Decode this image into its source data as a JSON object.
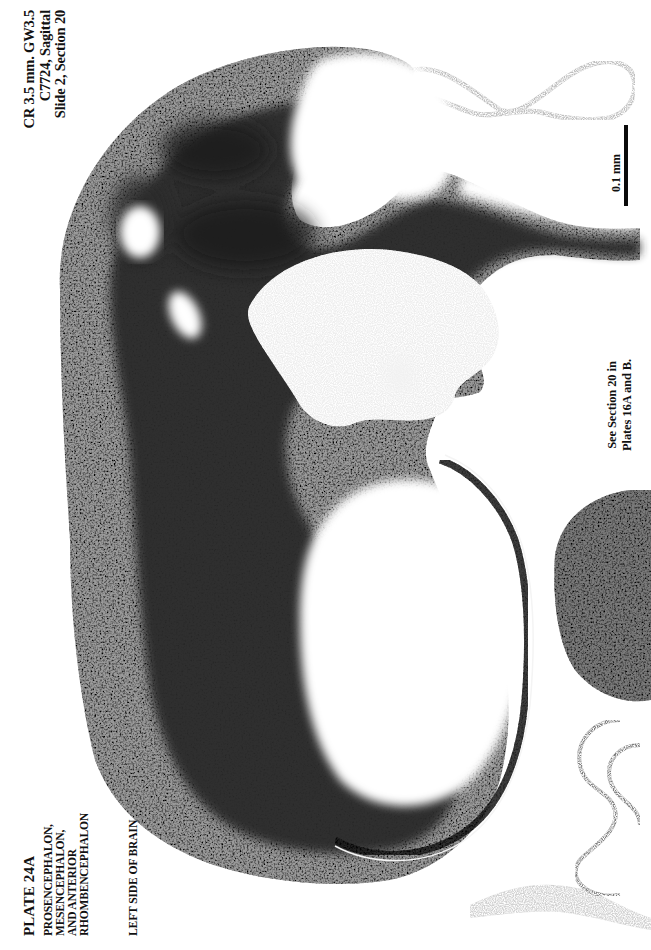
{
  "page": {
    "page_number_fragment": "30",
    "background": "#ffffff",
    "ink_color": "#111111"
  },
  "specimen_info": {
    "line1": "CR 3.5 mm. GW3.5",
    "line2": "C7724, Sagittal",
    "line3": "Slide 2, Section 20"
  },
  "plate": {
    "title": "PLATE 24A",
    "subtitle_lines": [
      "PROSENCEPHALON,",
      "MESENCEPHALON,",
      "AND ANTERIOR",
      "RHOMBENCEPHALON"
    ],
    "side_label": "LEFT SIDE OF BRAIN"
  },
  "cross_reference": {
    "line1": "See Section 20 in",
    "line2": "Plates 16A and B."
  },
  "scale_bar": {
    "label": "0.1 mm",
    "color": "#0a0a0a"
  },
  "micrograph": {
    "stain": "grayscale Nissl-like stain",
    "orientation": "rotated 90 degrees counter-clockwise",
    "tissue_color_dark": "#1a1a1a",
    "tissue_color_mid": "#6a6a6a",
    "tissue_color_light": "#c8c8c8"
  }
}
